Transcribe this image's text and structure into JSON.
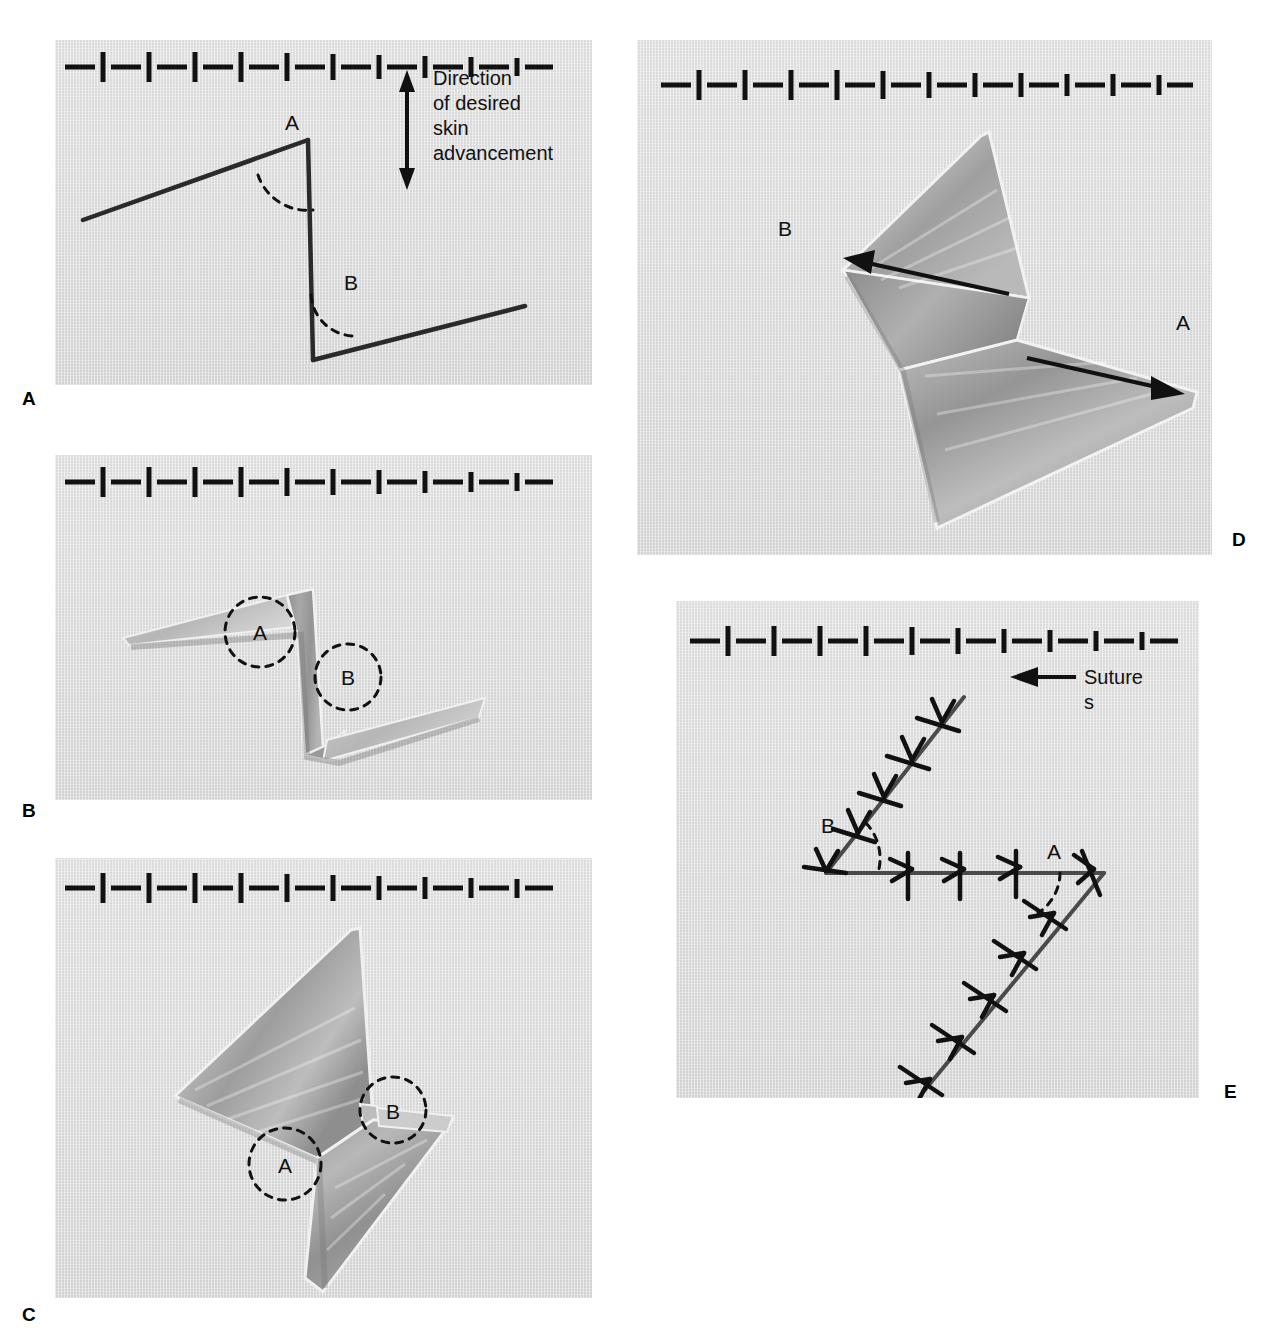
{
  "figure": {
    "background_color": "#ffffff",
    "panel_field_color": "#d8d8d8",
    "ink_color": "#111111"
  },
  "scale_bar": {
    "name": "centimeter-ruler",
    "description": "alternating horizontal dash and vertical tick marks",
    "segments": 11,
    "units": "cm"
  },
  "panels": [
    {
      "id": "A",
      "letter": "A",
      "caption_letter": "A",
      "stage": "planned incision lines marked on skin",
      "annotations": {
        "angle_a": "A",
        "angle_b": "B",
        "direction_note_lines": [
          "Direction",
          "of desired",
          "skin",
          "advancement"
        ],
        "direction_arrow": "double-headed-vertical-arrow"
      }
    },
    {
      "id": "B",
      "letter": "B",
      "caption_letter": "B",
      "stage": "flaps incised and elevated",
      "annotations": {
        "angle_a": "A",
        "angle_b": "B"
      }
    },
    {
      "id": "C",
      "letter": "C",
      "caption_letter": "C",
      "stage": "flaps undermined and ready for transposition",
      "annotations": {
        "angle_a": "A",
        "angle_b": "B"
      }
    },
    {
      "id": "D",
      "letter": "D",
      "caption_letter": "D",
      "stage": "flaps transposed, direction of movement shown",
      "annotations": {
        "flap_a": "A",
        "flap_b": "B",
        "arrow_a": "arrow-right",
        "arrow_b": "arrow-left"
      }
    },
    {
      "id": "E",
      "letter": "E",
      "caption_letter": "E",
      "stage": "final closure with interrupted sutures",
      "annotations": {
        "angle_a": "A",
        "angle_b": "B",
        "suture_label_lines": [
          "Suture",
          "s"
        ],
        "suture_leader": "arrow-left"
      }
    }
  ]
}
